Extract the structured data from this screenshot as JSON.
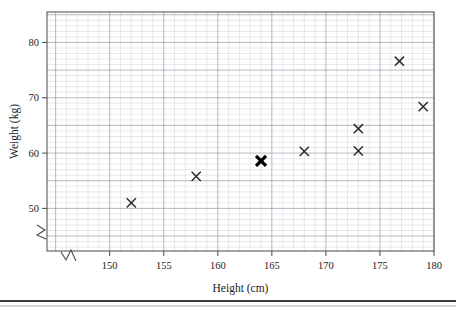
{
  "chart_data": {
    "type": "scatter",
    "title": "",
    "xlabel": "Height (cm)",
    "ylabel": "Weight (kg)",
    "xlim": [
      144.2,
      180
    ],
    "ylim": [
      42.3,
      85.5
    ],
    "x_ticks": [
      150,
      155,
      160,
      165,
      170,
      175,
      180
    ],
    "x_tick_labels": [
      "150",
      "155",
      "160",
      "165",
      "170",
      "175",
      "180"
    ],
    "y_ticks": [
      50,
      60,
      70,
      80
    ],
    "y_tick_labels": [
      "50",
      "60",
      "70",
      "80"
    ],
    "grid": "graph paper, minor 1mm, major 5mm",
    "axis_break": true,
    "legend": "none",
    "points": [
      {
        "x": 152,
        "y": 51,
        "style": "cross",
        "emphasis": false
      },
      {
        "x": 158,
        "y": 55.8,
        "style": "cross",
        "emphasis": false
      },
      {
        "x": 164,
        "y": 58.6,
        "style": "cross",
        "emphasis": true
      },
      {
        "x": 168,
        "y": 60.3,
        "style": "cross",
        "emphasis": false
      },
      {
        "x": 173,
        "y": 60.4,
        "style": "cross",
        "emphasis": false
      },
      {
        "x": 173,
        "y": 64.4,
        "style": "cross",
        "emphasis": false
      },
      {
        "x": 176.8,
        "y": 76.6,
        "style": "cross",
        "emphasis": false
      },
      {
        "x": 179,
        "y": 68.4,
        "style": "cross",
        "emphasis": false
      }
    ]
  },
  "labels": {
    "x_axis_title": "Height (cm)",
    "y_axis_title": "Weight (kg)"
  },
  "colors": {
    "marker": "#2b2b2b",
    "marker_emphasis": "#000000",
    "grid_minor": "#c9c6d2",
    "grid_major": "#9a96a8",
    "frame": "#58585c",
    "text": "#1c1c1c"
  }
}
